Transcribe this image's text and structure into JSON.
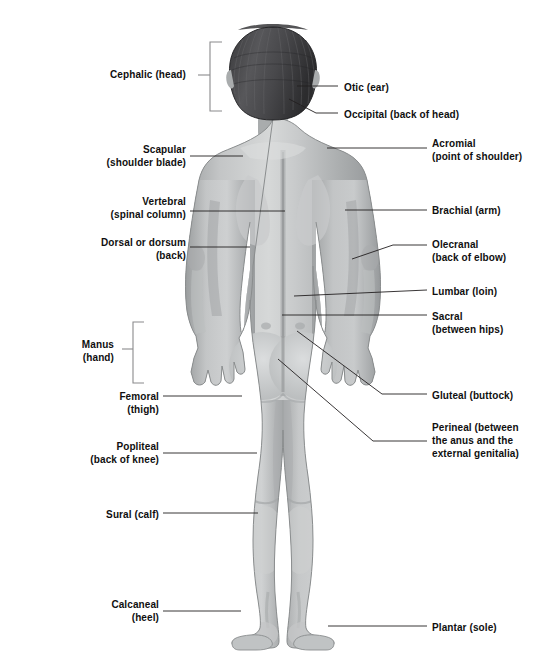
{
  "figure": {
    "view": "posterior",
    "skin_color": "#b0b2b3",
    "skin_light": "#d2d4d5",
    "skin_shadow": "#8e9193",
    "hair_color": "#4a4a4c",
    "hair_dark": "#2e2e30",
    "line_color": "#231f20",
    "bracket_color": "#8a8a8c",
    "background": "#ffffff"
  },
  "labels": {
    "left": [
      {
        "id": "cephalic",
        "text": "Cephalic (head)",
        "x": 108,
        "y": 68,
        "w": 78,
        "align": "right"
      },
      {
        "id": "scapular",
        "text": "Scapular\n(shoulder blade)",
        "x": 36,
        "y": 143,
        "w": 150,
        "align": "right"
      },
      {
        "id": "vertebral",
        "text": "Vertebral\n(spinal column)",
        "x": 36,
        "y": 195,
        "w": 150,
        "align": "right"
      },
      {
        "id": "dorsal",
        "text": "Dorsal or dorsum\n(back)",
        "x": 26,
        "y": 236,
        "w": 160,
        "align": "right"
      },
      {
        "id": "manus",
        "text": "Manus\n(hand)",
        "x": 46,
        "y": 338,
        "w": 68,
        "align": "right"
      },
      {
        "id": "femoral",
        "text": "Femoral\n(thigh)",
        "x": 46,
        "y": 390,
        "w": 113,
        "align": "right"
      },
      {
        "id": "popliteal",
        "text": "Popliteal\n(back of knee)",
        "x": 26,
        "y": 440,
        "w": 133,
        "align": "right"
      },
      {
        "id": "sural",
        "text": "Sural (calf)",
        "x": 46,
        "y": 508,
        "w": 113,
        "align": "right"
      },
      {
        "id": "calcaneal",
        "text": "Calcaneal\n(heel)",
        "x": 46,
        "y": 598,
        "w": 113,
        "align": "right"
      }
    ],
    "right": [
      {
        "id": "otic",
        "text": "Otic (ear)",
        "x": 344,
        "y": 81,
        "w": 190,
        "align": "left"
      },
      {
        "id": "occipital",
        "text": "Occipital (back of head)",
        "x": 344,
        "y": 108,
        "w": 198,
        "align": "left"
      },
      {
        "id": "acromial",
        "text": "Acromial\n(point of shoulder)",
        "x": 432,
        "y": 137,
        "w": 112,
        "align": "left"
      },
      {
        "id": "brachial",
        "text": "Brachial (arm)",
        "x": 432,
        "y": 204,
        "w": 112,
        "align": "left"
      },
      {
        "id": "olecranal",
        "text": "Olecranal\n(back of elbow)",
        "x": 432,
        "y": 238,
        "w": 112,
        "align": "left"
      },
      {
        "id": "lumbar",
        "text": "Lumbar (loin)",
        "x": 432,
        "y": 285,
        "w": 112,
        "align": "left"
      },
      {
        "id": "sacral",
        "text": "Sacral\n(between hips)",
        "x": 432,
        "y": 310,
        "w": 112,
        "align": "left"
      },
      {
        "id": "gluteal",
        "text": "Gluteal (buttock)",
        "x": 432,
        "y": 389,
        "w": 112,
        "align": "left"
      },
      {
        "id": "perineal",
        "text": "Perineal (between\nthe anus and the\nexternal genitalia)",
        "x": 432,
        "y": 421,
        "w": 114,
        "align": "left"
      },
      {
        "id": "plantar",
        "text": "Plantar (sole)",
        "x": 432,
        "y": 621,
        "w": 112,
        "align": "left"
      }
    ]
  },
  "leaders": {
    "cephalic_bracket": {
      "x": 210,
      "top": 42,
      "bottom": 111,
      "depth": 12,
      "tick_y": 75
    },
    "manus_bracket": {
      "x": 133,
      "top": 322,
      "bottom": 383,
      "depth": 11,
      "tick_y": 349
    },
    "lines": [
      {
        "id": "scapular-leader",
        "points": "190,156 243,156"
      },
      {
        "id": "vertebral-leader",
        "points": "190,211 285,211"
      },
      {
        "id": "dorsal-leader",
        "points": "190,247 250,247"
      },
      {
        "id": "femoral-leader",
        "points": "163,396 242,396"
      },
      {
        "id": "popliteal-leader",
        "points": "163,453 257,453"
      },
      {
        "id": "sural-leader",
        "points": "163,513 258,513"
      },
      {
        "id": "calcaneal-leader",
        "points": "163,611 241,611"
      },
      {
        "id": "otic-leader",
        "points": "297,86 338,86"
      },
      {
        "id": "occipital-leader",
        "points": "289,99 316,113 338,113"
      },
      {
        "id": "acromial-leader",
        "points": "327,148 427,148"
      },
      {
        "id": "brachial-leader",
        "points": "345,210 427,210"
      },
      {
        "id": "olecranal-leader",
        "points": "352,259 393,245 427,245"
      },
      {
        "id": "lumbar-leader",
        "points": "294,296 427,290"
      },
      {
        "id": "sacral-leader",
        "points": "282,315 427,315"
      },
      {
        "id": "gluteal-leader",
        "points": "297,331 382,394 427,394"
      },
      {
        "id": "perineal-leader",
        "points": "278,359 373,441 427,441"
      },
      {
        "id": "plantar-leader",
        "points": "328,626 427,626"
      }
    ]
  }
}
